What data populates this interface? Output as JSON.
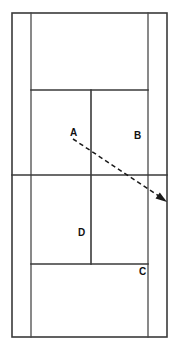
{
  "diagram": {
    "kind": "tennis-court-diagram",
    "title": "",
    "colors": {
      "background": "#ffffff",
      "court_line": "#3a3a3a",
      "shot_line": "#1a1a1a",
      "label_text": "#111111"
    },
    "labels": [
      {
        "id": "A",
        "text": "A",
        "x": 70,
        "y": 128
      },
      {
        "id": "B",
        "text": "B",
        "x": 134,
        "y": 131
      },
      {
        "id": "C",
        "text": "C",
        "x": 139,
        "y": 267
      },
      {
        "id": "D",
        "text": "D",
        "x": 78,
        "y": 228
      }
    ],
    "court_geometry": {
      "doubles_left_x": 12,
      "doubles_right_x": 167,
      "singles_left_x": 31,
      "singles_right_x": 148,
      "center_service_x": 91,
      "top_baseline_y": 13,
      "top_service_line_y": 90,
      "net_line_y": 175,
      "bottom_service_line_y": 264,
      "bottom_baseline_y": 337
    },
    "shot_arrow": {
      "from_x": 73,
      "from_y": 139,
      "to_x": 166,
      "to_y": 201,
      "style": "dashed",
      "arrowhead": "filled-triangle"
    }
  }
}
